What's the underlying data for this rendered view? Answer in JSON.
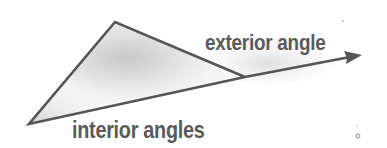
{
  "diagram": {
    "labels": {
      "exterior": "exterior angle",
      "interior": "interior angles"
    },
    "colors": {
      "stroke": "#555555",
      "text": "#5a5a5a",
      "shade": "#d0d0d0"
    },
    "shapes": {
      "triangle_vertices": [
        [
          29,
          124
        ],
        [
          115,
          22
        ],
        [
          245,
          77
        ]
      ],
      "extended_ray": {
        "from": [
          245,
          77
        ],
        "to": [
          361,
          55
        ]
      }
    }
  }
}
